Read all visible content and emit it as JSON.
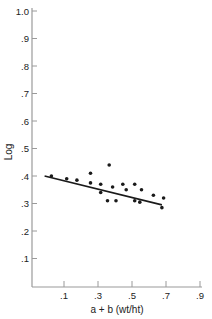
{
  "chart_data": {
    "type": "scatter",
    "title": "",
    "xlabel": "a + b (wt/ht)",
    "ylabel": "Log",
    "xlim": [
      0,
      0.9
    ],
    "ylim": [
      0,
      1.0
    ],
    "grid": false,
    "legend": null,
    "x_ticks": [
      0.1,
      0.3,
      0.5,
      0.7,
      0.9
    ],
    "x_tick_labels": [
      ".1",
      ".3",
      ".5",
      ".7",
      ".9"
    ],
    "y_ticks": [
      0.1,
      0.2,
      0.3,
      0.4,
      0.5,
      0.6,
      0.7,
      0.8,
      0.9,
      1.0
    ],
    "y_tick_labels": [
      ".1",
      ".2",
      ".3",
      ".4",
      ".5",
      ".6",
      ".7",
      ".8",
      ".9",
      "1.0"
    ],
    "points": [
      {
        "x": 0.02,
        "y": 0.4
      },
      {
        "x": 0.11,
        "y": 0.39
      },
      {
        "x": 0.17,
        "y": 0.385
      },
      {
        "x": 0.25,
        "y": 0.41
      },
      {
        "x": 0.25,
        "y": 0.375
      },
      {
        "x": 0.31,
        "y": 0.37
      },
      {
        "x": 0.31,
        "y": 0.34
      },
      {
        "x": 0.36,
        "y": 0.44
      },
      {
        "x": 0.35,
        "y": 0.31
      },
      {
        "x": 0.38,
        "y": 0.36
      },
      {
        "x": 0.4,
        "y": 0.31
      },
      {
        "x": 0.44,
        "y": 0.37
      },
      {
        "x": 0.46,
        "y": 0.35
      },
      {
        "x": 0.51,
        "y": 0.37
      },
      {
        "x": 0.51,
        "y": 0.31
      },
      {
        "x": 0.54,
        "y": 0.305
      },
      {
        "x": 0.55,
        "y": 0.35
      },
      {
        "x": 0.62,
        "y": 0.33
      },
      {
        "x": 0.67,
        "y": 0.285
      },
      {
        "x": 0.68,
        "y": 0.32
      }
    ],
    "regression_line": {
      "x1": -0.02,
      "y1": 0.4,
      "x2": 0.67,
      "y2": 0.295
    }
  },
  "colors": {
    "axis": "#9a9a9a",
    "ink": "#1a1a1a",
    "background": "#ffffff"
  }
}
